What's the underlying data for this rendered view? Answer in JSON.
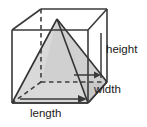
{
  "figure": {
    "labels": {
      "height": "height",
      "width": "width",
      "length": "length"
    },
    "colors": {
      "background": "#ffffff",
      "outline": "#3a3a3a",
      "hidden_edge": "#3a3a3a",
      "pyramid_fill_light": "#d9d9d9",
      "pyramid_fill_shade": "#c6c6c6",
      "label_text": "#1a1a1a"
    },
    "geometry": {
      "description": "Wireframe rectangular prism drawn in oblique projection with a shaded square-based pyramid inscribed inside; pyramid apex touches the top face center and its base coincides with the bottom face of the prism.",
      "prism_vertices": {
        "front_top_left": [
          12,
          30
        ],
        "front_top_right": [
          88,
          30
        ],
        "front_bottom_left": [
          12,
          103
        ],
        "front_bottom_right": [
          88,
          103
        ],
        "back_top_left": [
          41,
          9
        ],
        "back_top_right": [
          107,
          9
        ],
        "back_bottom_left": [
          41,
          82
        ],
        "back_bottom_right": [
          107,
          82
        ]
      },
      "hidden_edges": [
        "back_top_left-back_bottom_left",
        "back_bottom_left-back_bottom_right",
        "back_bottom_left-front_bottom_left"
      ],
      "pyramid_apex": [
        57,
        19
      ],
      "pyramid_base_vertices": {
        "front_left": [
          12,
          103
        ],
        "front_right": [
          88,
          103
        ],
        "back_right": [
          107,
          82
        ],
        "back_left": [
          41,
          82
        ]
      },
      "leader_lines": {
        "height": {
          "from": [
            101,
            34
          ],
          "to": [
            101,
            77
          ],
          "type": "plain-segment"
        },
        "width": {
          "from": [
            74,
            75
          ],
          "to": [
            99,
            75
          ],
          "type": "arrow-right"
        },
        "length": {
          "from": [
            22,
            99
          ],
          "to": [
            84,
            99
          ],
          "type": "arrow-right"
        }
      }
    }
  }
}
